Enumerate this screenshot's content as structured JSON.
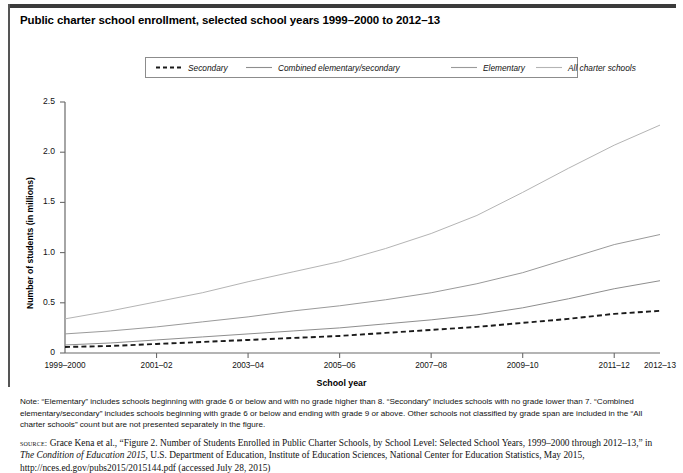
{
  "figure": {
    "title": "Public charter school enrollment, selected school years 1999–2000 to 2012–13",
    "note_label": "Note:",
    "note": "Note: “Elementary” includes schools beginning with grade 6 or below and with no grade higher than 8. “Secondary” includes schools with no grade lower than 7. “Combined elementary/secondary” includes schools beginning with grade 6 or below and ending with grade 9 or above. Other schools not classified by grade span are included in the “All charter schools” count but are not presented separately in the figure.",
    "source_tag": "source:",
    "source_part1": " Grace Kena et al., “Figure 2. Number of Students Enrolled in Public Charter Schools, by School Level: Selected School Years, 1999–2000 through 2012–13,” in ",
    "source_italic": "The Condition of Education 2015",
    "source_part2": ", U.S. Department of Education, Institute of Education Sciences, National Center for Education Statistics, May 2015, http://nces.ed.gov/pubs2015/2015144.pdf (accessed July 28, 2015)"
  },
  "chart_data": {
    "type": "line",
    "title": "Public charter school enrollment, selected school years 1999–2000 to 2012–13",
    "xlabel": "School year",
    "ylabel": "Number of students (in millions)",
    "ylim": [
      0,
      2.5
    ],
    "yticks": [
      0,
      0.5,
      1.0,
      1.5,
      2.0,
      2.5
    ],
    "ytick_labels": [
      "0",
      "0.5",
      "1.0",
      "1.5",
      "2.0",
      "2.5"
    ],
    "grid": false,
    "legend_position": "top-center",
    "x": [
      "1999–2000",
      "2000–01",
      "2001–02",
      "2002–03",
      "2003–04",
      "2004–05",
      "2005–06",
      "2006–07",
      "2007–08",
      "2008–09",
      "2009–10",
      "2010–11",
      "2011–12",
      "2012–13"
    ],
    "xtick_labels": [
      "1999–2000",
      "2001–02",
      "2003–04",
      "2005–06",
      "2007–08",
      "2009–10",
      "2011–12",
      "2012–13"
    ],
    "xtick_indices": [
      0,
      2,
      4,
      6,
      8,
      10,
      12,
      13
    ],
    "series": [
      {
        "name": "Secondary",
        "style": "dashed",
        "color": "#1a1a1a",
        "values": [
          0.06,
          0.07,
          0.09,
          0.11,
          0.13,
          0.15,
          0.17,
          0.2,
          0.23,
          0.26,
          0.3,
          0.34,
          0.39,
          0.42
        ]
      },
      {
        "name": "Combined elementary/secondary",
        "style": "solid",
        "color": "#8e8e8e",
        "values": [
          0.08,
          0.1,
          0.13,
          0.16,
          0.19,
          0.22,
          0.25,
          0.29,
          0.33,
          0.38,
          0.45,
          0.54,
          0.64,
          0.72
        ]
      },
      {
        "name": "Elementary",
        "style": "solid",
        "color": "#9a9a9a",
        "values": [
          0.19,
          0.22,
          0.26,
          0.31,
          0.36,
          0.42,
          0.47,
          0.53,
          0.6,
          0.69,
          0.8,
          0.94,
          1.08,
          1.18
        ]
      },
      {
        "name": "All charter schools",
        "style": "solid",
        "color": "#b4b4b4",
        "values": [
          0.34,
          0.42,
          0.51,
          0.6,
          0.71,
          0.81,
          0.91,
          1.04,
          1.19,
          1.37,
          1.6,
          1.84,
          2.07,
          2.27
        ]
      }
    ]
  }
}
